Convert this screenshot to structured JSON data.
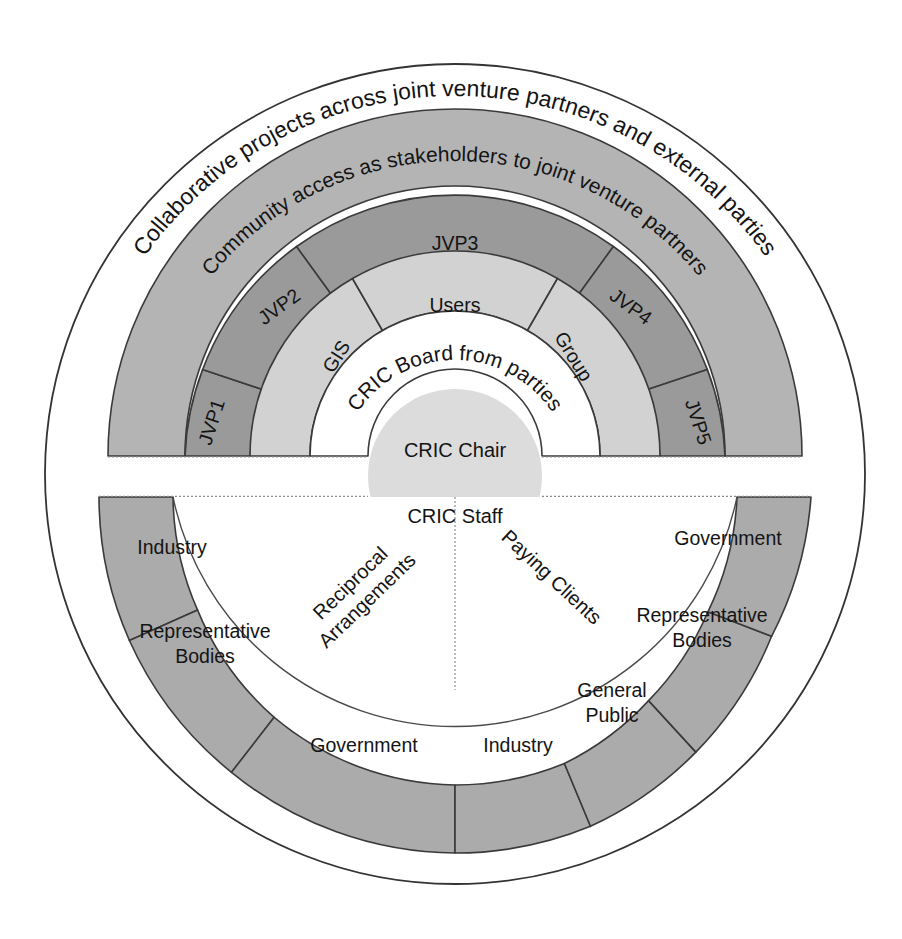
{
  "diagram": {
    "colors": {
      "outer_circle_fill": "#ffffff",
      "outer_circle_stroke": "#333333",
      "community_ring_fill": "#b4b4b4",
      "jvp_ring_fill": "#9a9a9a",
      "mid_ring_fill": "#d2d2d2",
      "board_ring_fill": "#ffffff",
      "core_fill": "#dcdcdc",
      "bottom_ring_fill": "#ababab",
      "segment_stroke": "#3a3a3a",
      "text_color": "#141414"
    },
    "outer_arc_label": "Collaborative projects across joint venture partners and external parties",
    "community_arc_label": "Community access as stakeholders to joint venture partners",
    "board_arc_label": "CRIC Board from parties",
    "core": {
      "top_label": "CRIC Chair",
      "bottom_label": "CRIC Staff"
    },
    "jvp_ring": {
      "name": "joint-venture-partners-ring",
      "segments": [
        {
          "id": "jvp1",
          "label": "JVP1"
        },
        {
          "id": "jvp2",
          "label": "JVP2"
        },
        {
          "id": "jvp3",
          "label": "JVP3"
        },
        {
          "id": "jvp4",
          "label": "JVP4"
        },
        {
          "id": "jvp5",
          "label": "JVP5"
        }
      ]
    },
    "user_ring": {
      "name": "user-group-ring",
      "segments": [
        {
          "id": "gis",
          "label": "GIS"
        },
        {
          "id": "users",
          "label": "Users"
        },
        {
          "id": "group",
          "label": "Group"
        }
      ]
    },
    "bottom_band": {
      "left_label": "Reciprocal Arrangements",
      "left_label_line1": "Reciprocal",
      "left_label_line2": "Arrangements",
      "right_label": "Paying Clients"
    },
    "bottom_ring": {
      "name": "external-stakeholders-ring",
      "segments": [
        {
          "id": "industry-left",
          "label": "Industry",
          "lines": [
            "Industry"
          ]
        },
        {
          "id": "representative-bodies-left",
          "label": "Representative Bodies",
          "lines": [
            "Representative",
            "Bodies"
          ]
        },
        {
          "id": "government-left",
          "label": "Government",
          "lines": [
            "Government"
          ]
        },
        {
          "id": "industry-right",
          "label": "Industry",
          "lines": [
            "Industry"
          ]
        },
        {
          "id": "general-public",
          "label": "General Public",
          "lines": [
            "General",
            "Public"
          ]
        },
        {
          "id": "representative-bodies-right",
          "label": "Representative Bodies",
          "lines": [
            "Representative",
            "Bodies"
          ]
        },
        {
          "id": "government-right",
          "label": "Government",
          "lines": [
            "Government"
          ]
        }
      ]
    }
  }
}
